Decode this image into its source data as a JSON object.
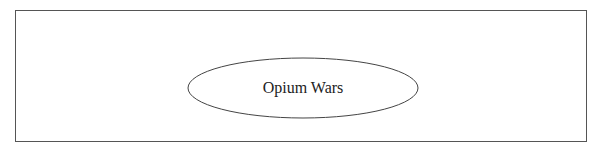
{
  "diagram": {
    "nodes": [
      {
        "id": "opium-wars",
        "label": "Opium Wars",
        "shape": "ellipse"
      }
    ],
    "colors": {
      "border": "#555555",
      "stroke": "#444444",
      "text": "#222222",
      "background": "#ffffff"
    }
  }
}
